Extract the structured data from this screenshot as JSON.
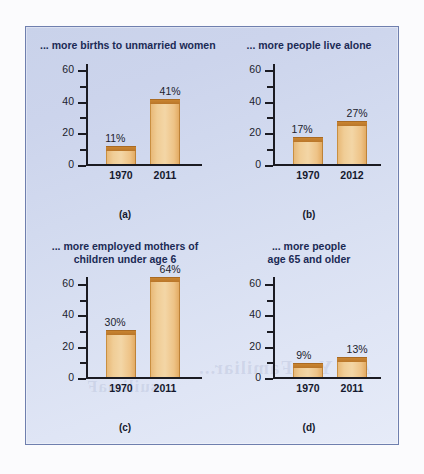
{
  "figure": {
    "panel_letters": [
      "(a)",
      "(b)",
      "(c)",
      "(d)"
    ],
    "accent_bar_color": "#f0cd96",
    "accent_bar_top_color": "#bd7a2c",
    "panel_background": "#d2daef",
    "panel_border_color": "#6f7fae",
    "title_color": "#1b2a55"
  },
  "bleed_through": {
    "line1": "Are You Familiar...",
    "line2": "suilimaF"
  },
  "chart_data": [
    {
      "type": "bar",
      "id": "a",
      "panel_letter": "(a)",
      "title": "... more births to unmarried women",
      "title_lines": [
        "... more births to unmarried women"
      ],
      "title_align": "left",
      "categories": [
        "1970",
        "2011"
      ],
      "values": [
        11,
        41
      ],
      "value_labels": [
        "11%",
        "41%"
      ],
      "xlabel": "",
      "ylabel": "",
      "ylim": [
        0,
        65
      ],
      "yticks": [
        0,
        20,
        40,
        60
      ],
      "ytick_labels": [
        "0",
        "20",
        "40",
        "60"
      ],
      "yticks_minor": [
        10,
        30,
        50
      ],
      "grid": false,
      "legend": "none"
    },
    {
      "type": "bar",
      "id": "b",
      "panel_letter": "(b)",
      "title": "... more people live alone",
      "title_lines": [
        "... more people live alone"
      ],
      "title_align": "center",
      "categories": [
        "1970",
        "2012"
      ],
      "values": [
        17,
        27
      ],
      "value_labels": [
        "17%",
        "27%"
      ],
      "xlabel": "",
      "ylabel": "",
      "ylim": [
        0,
        65
      ],
      "yticks": [
        0,
        20,
        40,
        60
      ],
      "ytick_labels": [
        "0",
        "20",
        "40",
        "60"
      ],
      "yticks_minor": [
        10,
        30,
        50
      ],
      "grid": false,
      "legend": "none"
    },
    {
      "type": "bar",
      "id": "c",
      "panel_letter": "(c)",
      "title": "... more employed mothers of children under age 6",
      "title_lines": [
        "... more employed mothers of",
        "children under age 6"
      ],
      "title_align": "center",
      "categories": [
        "1970",
        "2011"
      ],
      "values": [
        30,
        64
      ],
      "value_labels": [
        "30%",
        "64%"
      ],
      "xlabel": "",
      "ylabel": "",
      "ylim": [
        0,
        65
      ],
      "yticks": [
        0,
        20,
        40,
        60
      ],
      "ytick_labels": [
        "0",
        "20",
        "40",
        "60"
      ],
      "yticks_minor": [
        10,
        30,
        50
      ],
      "grid": false,
      "legend": "none"
    },
    {
      "type": "bar",
      "id": "d",
      "panel_letter": "(d)",
      "title": "... more people age 65 and older",
      "title_lines": [
        "... more people",
        "age 65 and older"
      ],
      "title_align": "center",
      "categories": [
        "1970",
        "2011"
      ],
      "values": [
        9,
        13
      ],
      "value_labels": [
        "9%",
        "13%"
      ],
      "xlabel": "",
      "ylabel": "",
      "ylim": [
        0,
        65
      ],
      "yticks": [
        0,
        20,
        40,
        60
      ],
      "ytick_labels": [
        "0",
        "20",
        "40",
        "60"
      ],
      "yticks_minor": [
        10,
        30,
        50
      ],
      "grid": false,
      "legend": "none"
    }
  ]
}
